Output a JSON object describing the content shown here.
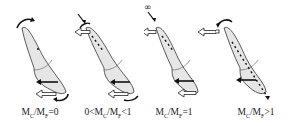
{
  "figure": {
    "panels": [
      {
        "id": "uncontrolled-tipping",
        "ratio_var": "M",
        "sub1": "C",
        "sub2": "F",
        "prefix": "",
        "relation": "=0",
        "label_text": "MC/MF=0"
      },
      {
        "id": "controlled-tipping",
        "ratio_var": "M",
        "sub1": "C",
        "sub2": "F",
        "prefix": "0<",
        "relation": "<1",
        "label_text": "0<MC/MF<1"
      },
      {
        "id": "translation",
        "ratio_var": "M",
        "sub1": "C",
        "sub2": "F",
        "prefix": "",
        "relation": "=1",
        "label_text": "MC/MF=1"
      },
      {
        "id": "root-movement",
        "ratio_var": "M",
        "sub1": "C",
        "sub2": "F",
        "prefix": "",
        "relation": ">1",
        "label_text": "MC/MF>1"
      }
    ],
    "infinity_symbol": "∞",
    "colors": {
      "tooth_fill": "#e6e6e6",
      "outline": "#333333",
      "arrow": "#111111",
      "open_arrow_fill": "#ffffff"
    }
  }
}
